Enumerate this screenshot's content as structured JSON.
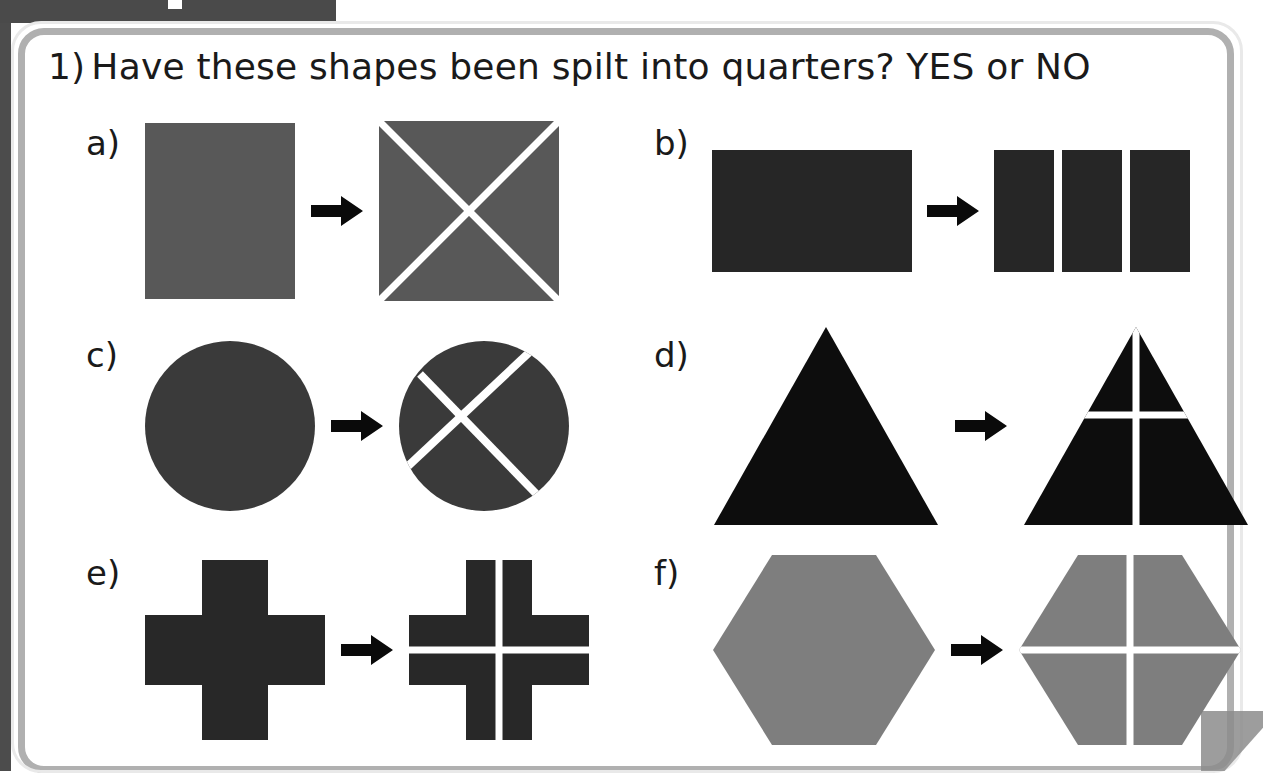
{
  "worksheet": {
    "question": {
      "number": "1)",
      "text": "Have these shapes been spilt into quarters? YES or NO"
    },
    "items": [
      {
        "label": "a)",
        "shape": "square",
        "shape_color": "#585858",
        "before_description": "whole square",
        "after_description": "square divided by two diagonals forming an X into 4 triangles",
        "divider_color": "#ffffff",
        "arrow": "right-arrow"
      },
      {
        "label": "b)",
        "shape": "rectangle",
        "shape_color": "#262626",
        "before_description": "whole rectangle",
        "after_description": "rectangle divided into 3 equal vertical strips",
        "divider_color": "#ffffff",
        "arrow": "right-arrow"
      },
      {
        "label": "c)",
        "shape": "circle",
        "shape_color": "#3a3a3a",
        "before_description": "whole circle",
        "after_description": "circle divided by two crossing chords into 4 unequal parts",
        "divider_color": "#ffffff",
        "arrow": "right-arrow"
      },
      {
        "label": "d)",
        "shape": "triangle",
        "shape_color": "#0d0d0d",
        "before_description": "whole triangle",
        "after_description": "triangle divided by one vertical and one horizontal line into 4 unequal parts",
        "divider_color": "#ffffff",
        "arrow": "right-arrow"
      },
      {
        "label": "e)",
        "shape": "cross",
        "shape_color": "#282828",
        "before_description": "whole cross/plus shape",
        "after_description": "cross divided by a vertical and a horizontal line into 4 equal quarters",
        "divider_color": "#ffffff",
        "arrow": "right-arrow"
      },
      {
        "label": "f)",
        "shape": "hexagon",
        "shape_color": "#7e7e7e",
        "before_description": "whole hexagon",
        "after_description": "hexagon divided by a vertical and a horizontal line into 4 equal quarters",
        "divider_color": "#ffffff",
        "arrow": "right-arrow"
      }
    ],
    "colors": {
      "frame_border": "#b0b0b0",
      "scan_edge": "#4a4a4a",
      "ink": "#1a1a1a",
      "divider": "#ffffff"
    }
  }
}
